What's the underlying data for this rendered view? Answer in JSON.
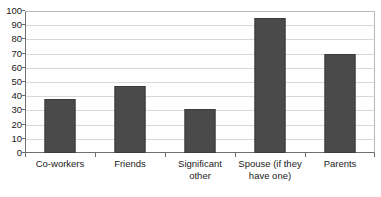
{
  "chart_data": {
    "type": "bar",
    "title": "",
    "subtitle": "",
    "xlabel": "",
    "ylabel": "",
    "categories": [
      "Co-workers",
      "Friends",
      "Significant other",
      "Spouse (if they have one)",
      "Parents"
    ],
    "category_lines": [
      [
        "Co-workers"
      ],
      [
        "Friends"
      ],
      [
        "Significant",
        "other"
      ],
      [
        "Spouse (if they",
        "have one)"
      ],
      [
        "Parents"
      ]
    ],
    "values": [
      38,
      47,
      31,
      95,
      70
    ],
    "ylim": [
      0,
      100
    ],
    "ytick_step": 10,
    "yticks": [
      0,
      10,
      20,
      30,
      40,
      50,
      60,
      70,
      80,
      90,
      100
    ],
    "ytick_labels": [
      "0",
      "10",
      "20",
      "30",
      "40",
      "50",
      "60",
      "70",
      "80",
      "90",
      "100"
    ],
    "grid": true,
    "grid_axis": "y",
    "legend": false,
    "legend_position": "none",
    "bar_color": "#4a4a4a",
    "bar_border_color": "#3b3b3b",
    "grid_color": "#d9d9d9",
    "axis_color": "#6e6e6e",
    "background_color": "#ffffff"
  }
}
